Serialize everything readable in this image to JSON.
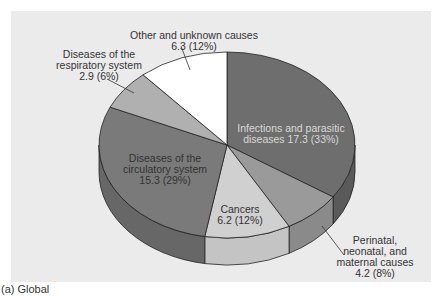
{
  "chart_data": {
    "type": "pie",
    "style": "3d",
    "title": "",
    "caption": "(a) Global",
    "units": "millions of deaths",
    "slices": [
      {
        "name": "Infections and parasitic diseases",
        "value": 17.3,
        "percent": 33,
        "color": "#6e6e6e",
        "side": "#5a5a5a"
      },
      {
        "name": "Perinatal, neonatal, and maternal causes",
        "value": 4.2,
        "percent": 8,
        "color": "#9a9a9a",
        "side": "#8a8a8a"
      },
      {
        "name": "Cancers",
        "value": 6.2,
        "percent": 12,
        "color": "#d0d0d0",
        "side": "#c4c4c4"
      },
      {
        "name": "Diseases of the circulatory system",
        "value": 15.3,
        "percent": 29,
        "color": "#7a7a7a",
        "side": "#676767"
      },
      {
        "name": "Diseases of the respiratory system",
        "value": 2.9,
        "percent": 6,
        "color": "#b0b0b0",
        "side": "#a0a0a0"
      },
      {
        "name": "Other and unknown causes",
        "value": 6.3,
        "percent": 12,
        "color": "#ffffff",
        "side": "#f0f0f0"
      }
    ]
  },
  "labels": {
    "infections": {
      "line1": "Infections and parasitic",
      "line2": "diseases 17.3 (33%)"
    },
    "perinatal": {
      "line1": "Perinatal,",
      "line2": "neonatal, and",
      "line3": "maternal causes",
      "line4": "4.2 (8%)"
    },
    "cancers": {
      "line1": "Cancers",
      "line2": "6.2 (12%)"
    },
    "circulatory": {
      "line1": "Diseases of the",
      "line2": "circulatory system",
      "line3": "15.3 (29%)"
    },
    "respiratory": {
      "line1": "Diseases of the",
      "line2": "respiratory system",
      "line3": "2.9 (6%)"
    },
    "other": {
      "line1": "Other and unknown causes",
      "line2": "6.3 (12%)"
    }
  },
  "caption": "(a) Global",
  "colors": {
    "panel": "#ebebeb",
    "outline": "#222222"
  }
}
